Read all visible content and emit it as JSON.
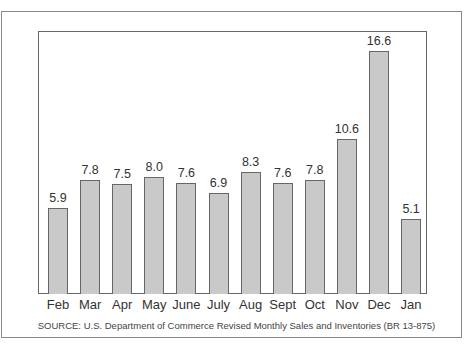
{
  "chart_data": {
    "type": "bar",
    "title": "",
    "xlabel": "",
    "ylabel": "",
    "categories": [
      "Feb",
      "Mar",
      "Apr",
      "May",
      "June",
      "July",
      "Aug",
      "Sept",
      "Oct",
      "Nov",
      "Dec",
      "Jan"
    ],
    "values": [
      5.9,
      7.8,
      7.5,
      8.0,
      7.6,
      6.9,
      8.3,
      7.6,
      7.8,
      10.6,
      16.6,
      5.1
    ],
    "value_labels": [
      "5.9",
      "7.8",
      "7.5",
      "8.0",
      "7.6",
      "6.9",
      "8.3",
      "7.6",
      "7.8",
      "10.6",
      "16.6",
      "5.1"
    ],
    "ylim": [
      0,
      17.5
    ],
    "grid": false,
    "legend": null,
    "bar_color": "#c9c9c9",
    "annotations": [
      "SOURCE: U.S. Department of Commerce Revised Monthly Sales and Inventories (BR 13-875)"
    ]
  },
  "source_note": "SOURCE: U.S. Department of Commerce Revised Monthly Sales and Inventories (BR 13-875)"
}
